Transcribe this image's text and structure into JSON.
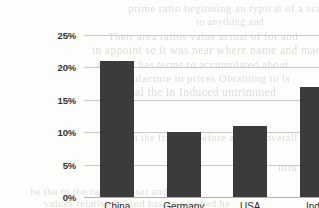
{
  "chart_data": {
    "type": "bar",
    "title": "",
    "subtitle": "",
    "xlabel": "",
    "ylabel": "",
    "categories": [
      "China",
      "Germany",
      "USA",
      "India"
    ],
    "values": [
      21,
      10,
      11,
      17
    ],
    "value_suffix": "%",
    "ylim": [
      0,
      25
    ],
    "y_ticks": [
      0,
      5,
      10,
      15,
      20,
      25
    ],
    "y_tick_labels": [
      "0%",
      "5%",
      "10%",
      "15%",
      "20%",
      "25%"
    ],
    "grid": true,
    "grid_axis": "y",
    "legend": false,
    "legend_position": "none",
    "series": [
      {
        "name": "",
        "values": [
          21,
          10,
          11,
          17
        ],
        "color": "#3b3b3b"
      }
    ],
    "annotations": []
  },
  "colors": {
    "bar": "#3b3b3b",
    "gridline": "#c8c8c8",
    "baseline": "#b0b0b0",
    "page_background": "#fdfdfb",
    "tick_text": "#35332f",
    "category_text": "#2e2c29",
    "bleed_text": "#d9d7d2"
  },
  "background_bleed": {
    "description": "faint show-through text from the reverse of the scanned page",
    "lines": [
      {
        "text": "prime ratio beginning an typical of a scan",
        "x": 128,
        "y": 2,
        "size": 11
      },
      {
        "text": "to anything and",
        "x": 196,
        "y": 16,
        "size": 10
      },
      {
        "text": "Their area ratios value actual of for and",
        "x": 108,
        "y": 30,
        "size": 11
      },
      {
        "text": "in appoint se it was near where name and made",
        "x": 92,
        "y": 44,
        "size": 11.5
      },
      {
        "text": "a region has terms to accumulated about",
        "x": 96,
        "y": 58,
        "size": 11
      },
      {
        "text": "manufacture in prices Obtaining to is",
        "x": 112,
        "y": 72,
        "size": 11
      },
      {
        "text": "an Total the in Induced untrimmed",
        "x": 104,
        "y": 86,
        "size": 11.5
      },
      {
        "text": "from the fraction before and the overall",
        "x": 116,
        "y": 132,
        "size": 10.5
      },
      {
        "text": "nou",
        "x": 278,
        "y": 160,
        "size": 12
      },
      {
        "text": "be the to the rate prior set and from",
        "x": 30,
        "y": 186,
        "size": 10.5
      },
      {
        "text": "values relative behind has an scanned he",
        "x": 44,
        "y": 198,
        "size": 10.5
      }
    ]
  }
}
